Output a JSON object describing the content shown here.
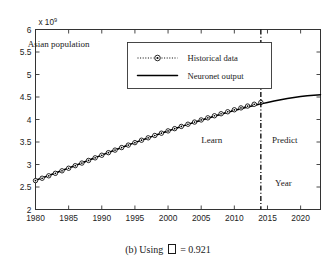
{
  "figure": {
    "caption_prefix": "(b) Using",
    "caption_symbol": "□",
    "caption_suffix": "= 0.921",
    "caption_full": "(b) Using □ = 0.921"
  },
  "chart_data": {
    "type": "line",
    "title": "",
    "annotation_title": "Asian population",
    "xlabel": "Year",
    "ylabel": "",
    "y_exponent_label": "x 10",
    "y_exponent_power": "9",
    "xlim": [
      1980,
      2023
    ],
    "ylim": [
      2,
      6
    ],
    "xticks": [
      1980,
      1985,
      1990,
      1995,
      2000,
      2005,
      2010,
      2015,
      2020
    ],
    "xticklabels": [
      "1980",
      "1985",
      "1990",
      "1995",
      "2000",
      "2005",
      "2010",
      "2015",
      "2020"
    ],
    "yticks": [
      2,
      2.5,
      3,
      3.5,
      4,
      4.5,
      5,
      5.5,
      6
    ],
    "yticklabels": [
      "2",
      "2.5",
      "3",
      "3.5",
      "4",
      "4.5",
      "5",
      "5.5",
      "6"
    ],
    "grid": false,
    "legend_position": "upper center",
    "legend": [
      {
        "label": "Historical data",
        "style": "dotted-marker",
        "marker": "circle"
      },
      {
        "label": "Neuronet output",
        "style": "solid",
        "marker": "none"
      }
    ],
    "annotations": [
      {
        "text": "Asian population",
        "x": 1983.5,
        "y": 5.62
      },
      {
        "text": "Learn",
        "x": 2006.6,
        "y": 3.47
      },
      {
        "text": "Predict",
        "x": 2017.6,
        "y": 3.47
      },
      {
        "text": "Year",
        "x": 2017.4,
        "y": 2.52
      }
    ],
    "divider": {
      "x": 2014,
      "style": "dash-dot",
      "label": "learn/predict boundary"
    },
    "series": [
      {
        "name": "Historical data",
        "x": [
          1980,
          1981,
          1982,
          1983,
          1984,
          1985,
          1986,
          1987,
          1988,
          1989,
          1990,
          1991,
          1992,
          1993,
          1994,
          1995,
          1996,
          1997,
          1998,
          1999,
          2000,
          2001,
          2002,
          2003,
          2004,
          2005,
          2006,
          2007,
          2008,
          2009,
          2010,
          2011,
          2012,
          2013,
          2014
        ],
        "values": [
          2.642,
          2.695,
          2.749,
          2.804,
          2.86,
          2.917,
          2.974,
          3.032,
          3.09,
          3.148,
          3.206,
          3.263,
          3.32,
          3.376,
          3.431,
          3.486,
          3.54,
          3.593,
          3.645,
          3.696,
          3.747,
          3.797,
          3.846,
          3.895,
          3.943,
          3.99,
          4.037,
          4.083,
          4.128,
          4.172,
          4.216,
          4.258,
          4.299,
          4.339,
          4.378
        ]
      },
      {
        "name": "Neuronet output",
        "x": [
          1980,
          1981,
          1982,
          1983,
          1984,
          1985,
          1986,
          1987,
          1988,
          1989,
          1990,
          1991,
          1992,
          1993,
          1994,
          1995,
          1996,
          1997,
          1998,
          1999,
          2000,
          2001,
          2002,
          2003,
          2004,
          2005,
          2006,
          2007,
          2008,
          2009,
          2010,
          2011,
          2012,
          2013,
          2014,
          2015,
          2016,
          2017,
          2018,
          2019,
          2020,
          2021,
          2022,
          2023
        ],
        "values": [
          2.651,
          2.703,
          2.756,
          2.81,
          2.865,
          2.921,
          2.978,
          3.035,
          3.093,
          3.151,
          3.209,
          3.266,
          3.322,
          3.378,
          3.433,
          3.487,
          3.54,
          3.592,
          3.644,
          3.695,
          3.745,
          3.794,
          3.843,
          3.891,
          3.938,
          3.984,
          4.029,
          4.073,
          4.116,
          4.158,
          4.199,
          4.238,
          4.276,
          4.312,
          4.347,
          4.38,
          4.411,
          4.44,
          4.466,
          4.489,
          4.509,
          4.527,
          4.541,
          4.552
        ]
      }
    ]
  }
}
